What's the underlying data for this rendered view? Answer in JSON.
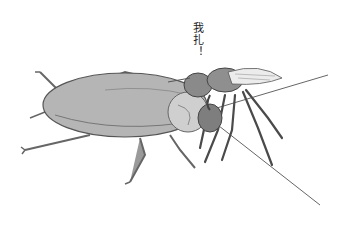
{
  "illustration": {
    "subject": "wasp stinging cockroach",
    "caption": "我扎！",
    "colors": {
      "background": "#ffffff",
      "cockroach_body": "#b5b5b5",
      "cockroach_outline": "#555555",
      "wasp_body": "#8a8a8a",
      "wasp_wing": "#e6e6e6",
      "line": "#444444"
    }
  }
}
